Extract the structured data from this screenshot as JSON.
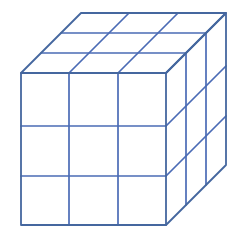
{
  "figure": {
    "shape_name": "cube",
    "divisions_x": 3,
    "divisions_y": 3,
    "divisions_z": 3,
    "total_unit_cubes": 27,
    "background_color": "#ffffff",
    "line_color": "#4a6bb5",
    "edge_color": "#45679f",
    "line_width": 1.8,
    "projection": "oblique",
    "faces_visible": [
      "front",
      "top",
      "right"
    ]
  },
  "geometry": {
    "front_top_left": [
      21,
      73
    ],
    "front_top_right": [
      166,
      73
    ],
    "front_bottom_left": [
      21,
      225
    ],
    "front_bottom_right": [
      166,
      225
    ],
    "back_top_left": [
      81,
      13
    ],
    "back_top_right": [
      226,
      13
    ],
    "back_bottom_right": [
      226,
      165
    ],
    "depth_offset": [
      60,
      -60
    ],
    "front_width": 145,
    "front_height": 152,
    "front_column_x": [
      21,
      69,
      118,
      166
    ],
    "front_row_y": [
      73,
      126,
      176,
      225
    ],
    "canvas_width": 243,
    "canvas_height": 241
  }
}
